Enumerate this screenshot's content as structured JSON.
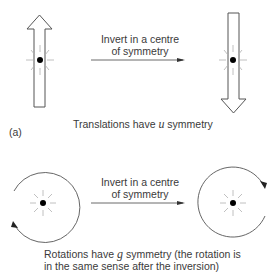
{
  "panel_a": {
    "label": "(a)",
    "arrow_caption_line1": "Invert in a centre",
    "arrow_caption_line2": "of symmetry",
    "caption_pre": "Translations have ",
    "caption_symbol": "u",
    "caption_post": " symmetry",
    "left_figure": "upward-translation-arrow",
    "right_figure": "downward-translation-arrow"
  },
  "panel_b": {
    "arrow_caption_line1": "Invert in a centre",
    "arrow_caption_line2": "of symmetry",
    "caption_line1_pre": "Rotations have ",
    "caption_symbol": "g",
    "caption_line1_post": " symmetry (the rotation is",
    "caption_line2": "in the same sense after the inversion)",
    "left_figure": "rotation-circle-arrowhead-lower-left",
    "right_figure": "rotation-circle-arrowhead-upper-right"
  },
  "colors": {
    "stroke": "#555555",
    "dot": "#000000",
    "rays": "#aaaaaa",
    "text": "#3a3a3a"
  }
}
